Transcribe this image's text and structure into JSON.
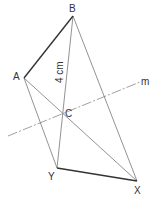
{
  "diagram": {
    "points": {
      "A": {
        "label": "A",
        "x": 24,
        "y": 78
      },
      "B": {
        "label": "B",
        "x": 73,
        "y": 16
      },
      "C": {
        "label": "C",
        "x": 62,
        "y": 114
      },
      "Y": {
        "label": "Y",
        "x": 57,
        "y": 168
      },
      "X": {
        "label": "X",
        "x": 137,
        "y": 181
      }
    },
    "line_m_label": "m",
    "measurement_label": "4 cm",
    "colors": {
      "thick_line": "#333333",
      "thin_line": "#777777",
      "label": "#333333"
    }
  }
}
